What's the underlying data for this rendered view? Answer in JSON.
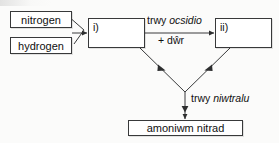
{
  "diagram": {
    "stroke_color": "#38393a",
    "text_color": "#101010",
    "background_color": "#fbfbfa",
    "nodes": {
      "nitrogen": {
        "label": "nitrogen"
      },
      "hydrogen": {
        "label": "hydrogen"
      },
      "step_one": {
        "label": "i)"
      },
      "step_two": {
        "label": "ii)"
      },
      "product": {
        "label": "amoniwm nitrad"
      }
    },
    "edge_labels": {
      "oxidise_prefix": "trwy ",
      "oxidise_term": "ocsidio",
      "plus_water": "+ dŵr",
      "neutralise_prefix": "trwy ",
      "neutralise_term": "niwtralu"
    }
  }
}
